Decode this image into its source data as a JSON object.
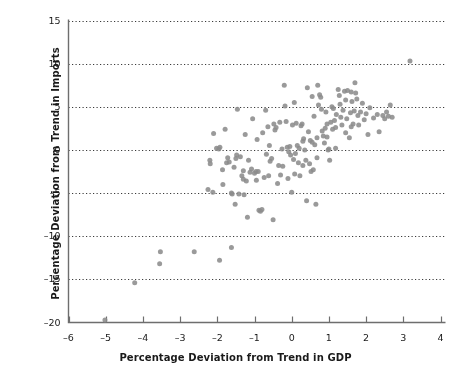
{
  "chart_data": {
    "type": "scatter",
    "title": "",
    "xlabel": "Percentage Deviation from Trend in GDP",
    "ylabel": "Percentage Deviation from Trend in Imports",
    "xlim": [
      -6,
      4
    ],
    "ylim": [
      -20,
      15
    ],
    "xticks": [
      -6,
      -5,
      -4,
      -3,
      -2,
      -1,
      0,
      1,
      2,
      3,
      4
    ],
    "xticklabels": [
      "-6",
      "-5",
      "-4",
      "-3",
      "-2",
      "-1",
      "0",
      "1",
      "2",
      "3",
      "4"
    ],
    "yticks": [
      -20,
      -15,
      -10,
      -5,
      0,
      5,
      10,
      15
    ],
    "yticklabels": [
      "-20",
      "-15",
      "-10",
      "-5",
      "0",
      "5",
      "10",
      "15"
    ],
    "grid": "horizontal-dotted",
    "gridlines_y": [
      -15,
      -10,
      -5,
      0,
      5,
      10,
      15
    ],
    "legend": "none",
    "marker": {
      "shape": "circle",
      "color": "#8c8c8c",
      "size_px": 5,
      "opacity": 0.88
    },
    "series": [
      {
        "name": "GDP vs Imports deviation from trend",
        "points": [
          [
            -5.02,
            -19.7
          ],
          [
            -4.22,
            -15.4
          ],
          [
            -3.53,
            -11.8
          ],
          [
            -3.55,
            -13.2
          ],
          [
            -2.62,
            -11.8
          ],
          [
            -1.94,
            -12.8
          ],
          [
            -1.62,
            -11.3
          ],
          [
            -2.25,
            -4.6
          ],
          [
            -2.12,
            -4.9
          ],
          [
            -2.2,
            -1.2
          ],
          [
            -2.19,
            -1.6
          ],
          [
            -2.1,
            1.9
          ],
          [
            -2.02,
            0.2
          ],
          [
            -1.96,
            0.1
          ],
          [
            -1.93,
            0.3
          ],
          [
            -1.86,
            -2.3
          ],
          [
            -1.85,
            -4.0
          ],
          [
            -1.79,
            2.4
          ],
          [
            -1.72,
            -0.9
          ],
          [
            -1.68,
            -1.4
          ],
          [
            -1.62,
            -5.0
          ],
          [
            -1.6,
            -5.1
          ],
          [
            -1.55,
            -2.0
          ],
          [
            -1.52,
            -6.3
          ],
          [
            -1.48,
            -0.6
          ],
          [
            -1.46,
            4.7
          ],
          [
            -1.42,
            -5.1
          ],
          [
            -1.38,
            -0.8
          ],
          [
            -1.34,
            -3.0
          ],
          [
            -1.3,
            -3.4
          ],
          [
            -1.28,
            -5.2
          ],
          [
            -1.25,
            1.8
          ],
          [
            -1.22,
            -3.6
          ],
          [
            -1.19,
            -7.8
          ],
          [
            -1.16,
            -1.2
          ],
          [
            -1.12,
            -2.6
          ],
          [
            -1.08,
            -2.2
          ],
          [
            -1.05,
            3.6
          ],
          [
            -1.0,
            -2.7
          ],
          [
            -0.96,
            -2.5
          ],
          [
            -0.93,
            1.2
          ],
          [
            -0.9,
            -2.5
          ],
          [
            -0.88,
            -7.0
          ],
          [
            -0.84,
            -7.1
          ],
          [
            -0.8,
            -6.9
          ],
          [
            -0.78,
            2.0
          ],
          [
            -0.74,
            -3.2
          ],
          [
            -0.7,
            4.6
          ],
          [
            -0.68,
            -0.5
          ],
          [
            -0.64,
            2.7
          ],
          [
            -0.6,
            0.5
          ],
          [
            -0.58,
            -1.3
          ],
          [
            -0.54,
            -1.0
          ],
          [
            -0.5,
            -8.1
          ],
          [
            -0.48,
            3.0
          ],
          [
            -0.45,
            2.3
          ],
          [
            -0.42,
            2.6
          ],
          [
            -0.38,
            -3.9
          ],
          [
            -0.35,
            -1.8
          ],
          [
            -0.32,
            3.2
          ],
          [
            -0.3,
            -2.9
          ],
          [
            -0.26,
            0.1
          ],
          [
            -0.24,
            -1.9
          ],
          [
            -0.2,
            7.5
          ],
          [
            -0.18,
            5.1
          ],
          [
            -0.15,
            3.3
          ],
          [
            -0.12,
            0.3
          ],
          [
            -0.1,
            -3.3
          ],
          [
            -0.08,
            -0.2
          ],
          [
            -0.05,
            0.4
          ],
          [
            -0.03,
            -0.6
          ],
          [
            0.0,
            -4.9
          ],
          [
            0.02,
            2.9
          ],
          [
            0.05,
            -1.1
          ],
          [
            0.07,
            5.5
          ],
          [
            0.1,
            -0.4
          ],
          [
            0.12,
            3.1
          ],
          [
            0.15,
            0.5
          ],
          [
            0.18,
            -1.5
          ],
          [
            0.2,
            0.2
          ],
          [
            0.22,
            -3.0
          ],
          [
            0.25,
            2.8
          ],
          [
            0.28,
            3.0
          ],
          [
            0.3,
            -1.8
          ],
          [
            0.32,
            1.3
          ],
          [
            0.35,
            0.0
          ],
          [
            0.38,
            -1.2
          ],
          [
            0.4,
            -5.9
          ],
          [
            0.42,
            7.2
          ],
          [
            0.45,
            2.1
          ],
          [
            0.48,
            -1.6
          ],
          [
            0.5,
            1.1
          ],
          [
            0.52,
            -2.5
          ],
          [
            0.55,
            6.2
          ],
          [
            0.58,
            -2.3
          ],
          [
            0.6,
            3.9
          ],
          [
            0.62,
            0.6
          ],
          [
            0.65,
            -6.3
          ],
          [
            0.68,
            1.4
          ],
          [
            0.7,
            7.5
          ],
          [
            0.72,
            5.2
          ],
          [
            0.75,
            6.4
          ],
          [
            0.78,
            6.1
          ],
          [
            0.8,
            4.7
          ],
          [
            0.82,
            2.2
          ],
          [
            0.85,
            1.6
          ],
          [
            0.88,
            0.8
          ],
          [
            0.9,
            2.5
          ],
          [
            0.92,
            4.4
          ],
          [
            0.95,
            1.5
          ],
          [
            0.98,
            0.0
          ],
          [
            1.0,
            0.1
          ],
          [
            1.02,
            -1.2
          ],
          [
            1.05,
            3.2
          ],
          [
            1.08,
            5.0
          ],
          [
            1.1,
            2.4
          ],
          [
            1.12,
            4.8
          ],
          [
            1.15,
            3.4
          ],
          [
            1.18,
            2.6
          ],
          [
            1.2,
            4.1
          ],
          [
            1.25,
            7.0
          ],
          [
            1.28,
            6.3
          ],
          [
            1.3,
            5.3
          ],
          [
            1.32,
            3.8
          ],
          [
            1.35,
            2.9
          ],
          [
            1.38,
            4.6
          ],
          [
            1.42,
            6.8
          ],
          [
            1.45,
            5.8
          ],
          [
            1.48,
            3.6
          ],
          [
            1.5,
            6.9
          ],
          [
            1.55,
            1.4
          ],
          [
            1.58,
            4.3
          ],
          [
            1.6,
            6.7
          ],
          [
            1.62,
            5.6
          ],
          [
            1.65,
            3.0
          ],
          [
            1.68,
            4.5
          ],
          [
            1.7,
            7.8
          ],
          [
            1.72,
            6.6
          ],
          [
            1.75,
            5.9
          ],
          [
            1.78,
            4.0
          ],
          [
            1.8,
            2.9
          ],
          [
            1.85,
            4.4
          ],
          [
            1.9,
            5.4
          ],
          [
            1.95,
            3.5
          ],
          [
            2.0,
            4.2
          ],
          [
            2.05,
            1.8
          ],
          [
            2.1,
            4.9
          ],
          [
            2.2,
            3.7
          ],
          [
            2.3,
            4.1
          ],
          [
            2.35,
            2.1
          ],
          [
            2.45,
            4.0
          ],
          [
            2.5,
            3.6
          ],
          [
            2.55,
            4.4
          ],
          [
            2.6,
            3.9
          ],
          [
            2.65,
            5.2
          ],
          [
            2.7,
            3.8
          ],
          [
            3.18,
            10.3
          ],
          [
            -1.75,
            -1.5
          ],
          [
            -1.5,
            -1.0
          ],
          [
            -1.3,
            -2.4
          ],
          [
            -0.95,
            -3.5
          ],
          [
            -0.62,
            -3.0
          ],
          [
            0.08,
            -2.8
          ],
          [
            0.3,
            1.0
          ],
          [
            0.55,
            0.9
          ],
          [
            0.68,
            -0.9
          ],
          [
            0.95,
            3.0
          ],
          [
            1.18,
            0.2
          ],
          [
            1.45,
            2.0
          ],
          [
            1.6,
            2.7
          ]
        ]
      }
    ]
  },
  "axes": {
    "x_title": "Percentage Deviation from Trend in GDP",
    "y_title": "Percentage Deviation from Trend in Imports"
  }
}
